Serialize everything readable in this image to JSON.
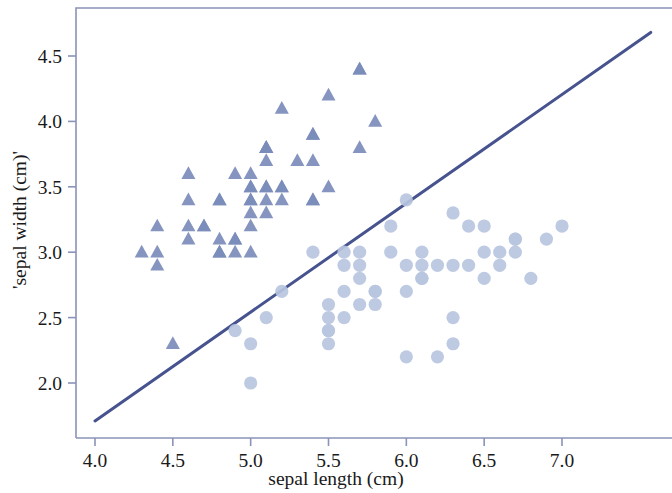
{
  "chart_data": {
    "type": "scatter",
    "title": "",
    "xlabel": "sepal length (cm)",
    "ylabel": "'sepal width (cm)'",
    "xlim": [
      3.75,
      7.65
    ],
    "ylim": [
      1.57,
      4.85
    ],
    "xticks": [
      4.0,
      4.5,
      5.0,
      5.5,
      6.0,
      6.5,
      7.0
    ],
    "xtick_labels": [
      "4.0",
      "4.5",
      "5.0",
      "5.5",
      "6.0",
      "6.5",
      "7.0"
    ],
    "yticks": [
      2.0,
      2.5,
      3.0,
      3.5,
      4.0,
      4.5
    ],
    "ytick_labels": [
      "2.0",
      "2.5",
      "3.0",
      "3.5",
      "4.0",
      "4.5"
    ],
    "grid": false,
    "legend": "none",
    "colors": {
      "triangle_marker": "#7b8cba",
      "circle_marker": "#b9c5e0",
      "fit_line": "#46538f",
      "frame": "#8a93b8",
      "text": "#1a1a1a",
      "background": "#ffffff"
    },
    "series": [
      {
        "name": "setosa",
        "marker": "triangle",
        "color": "#7b8cba",
        "points": [
          [
            4.3,
            3.0
          ],
          [
            4.4,
            3.2
          ],
          [
            4.4,
            3.0
          ],
          [
            4.4,
            2.9
          ],
          [
            4.5,
            2.3
          ],
          [
            4.6,
            3.6
          ],
          [
            4.6,
            3.4
          ],
          [
            4.6,
            3.2
          ],
          [
            4.6,
            3.1
          ],
          [
            4.7,
            3.2
          ],
          [
            4.7,
            3.2
          ],
          [
            4.8,
            3.4
          ],
          [
            4.8,
            3.4
          ],
          [
            4.8,
            3.1
          ],
          [
            4.8,
            3.0
          ],
          [
            4.8,
            3.0
          ],
          [
            4.9,
            3.6
          ],
          [
            4.9,
            3.1
          ],
          [
            4.9,
            3.1
          ],
          [
            4.9,
            3.0
          ],
          [
            5.0,
            3.6
          ],
          [
            5.0,
            3.5
          ],
          [
            5.0,
            3.4
          ],
          [
            5.0,
            3.4
          ],
          [
            5.0,
            3.3
          ],
          [
            5.0,
            3.2
          ],
          [
            5.0,
            3.0
          ],
          [
            5.0,
            3.5
          ],
          [
            5.1,
            3.8
          ],
          [
            5.1,
            3.8
          ],
          [
            5.1,
            3.7
          ],
          [
            5.1,
            3.5
          ],
          [
            5.1,
            3.5
          ],
          [
            5.1,
            3.4
          ],
          [
            5.1,
            3.3
          ],
          [
            5.1,
            3.8
          ],
          [
            5.2,
            4.1
          ],
          [
            5.2,
            3.5
          ],
          [
            5.2,
            3.4
          ],
          [
            5.2,
            3.5
          ],
          [
            5.3,
            3.7
          ],
          [
            5.4,
            3.9
          ],
          [
            5.4,
            3.9
          ],
          [
            5.4,
            3.7
          ],
          [
            5.4,
            3.4
          ],
          [
            5.4,
            3.4
          ],
          [
            5.5,
            4.2
          ],
          [
            5.5,
            3.5
          ],
          [
            5.7,
            4.4
          ],
          [
            5.7,
            4.4
          ],
          [
            5.7,
            3.8
          ],
          [
            5.8,
            4.0
          ]
        ]
      },
      {
        "name": "versicolor",
        "marker": "circle",
        "color": "#b9c5e0",
        "points": [
          [
            4.9,
            2.4
          ],
          [
            5.0,
            2.0
          ],
          [
            5.0,
            2.3
          ],
          [
            5.1,
            2.5
          ],
          [
            5.2,
            2.7
          ],
          [
            5.4,
            3.0
          ],
          [
            5.5,
            2.6
          ],
          [
            5.5,
            2.5
          ],
          [
            5.5,
            2.4
          ],
          [
            5.5,
            2.4
          ],
          [
            5.5,
            2.3
          ],
          [
            5.6,
            3.0
          ],
          [
            5.6,
            2.9
          ],
          [
            5.6,
            2.7
          ],
          [
            5.6,
            2.5
          ],
          [
            5.7,
            3.0
          ],
          [
            5.7,
            2.9
          ],
          [
            5.7,
            2.8
          ],
          [
            5.7,
            2.6
          ],
          [
            5.8,
            2.7
          ],
          [
            5.8,
            2.7
          ],
          [
            5.8,
            2.6
          ],
          [
            5.9,
            3.2
          ],
          [
            5.9,
            3.0
          ],
          [
            6.0,
            3.4
          ],
          [
            6.0,
            2.9
          ],
          [
            6.0,
            2.7
          ],
          [
            6.0,
            2.2
          ],
          [
            6.1,
            3.0
          ],
          [
            6.1,
            2.9
          ],
          [
            6.1,
            2.8
          ],
          [
            6.1,
            2.8
          ],
          [
            6.2,
            2.9
          ],
          [
            6.2,
            2.2
          ],
          [
            6.3,
            3.3
          ],
          [
            6.3,
            2.9
          ],
          [
            6.3,
            2.5
          ],
          [
            6.3,
            2.3
          ],
          [
            6.4,
            3.2
          ],
          [
            6.4,
            2.9
          ],
          [
            6.5,
            3.2
          ],
          [
            6.5,
            2.8
          ],
          [
            6.5,
            3.0
          ],
          [
            6.6,
            3.0
          ],
          [
            6.6,
            2.9
          ],
          [
            6.7,
            3.1
          ],
          [
            6.7,
            3.0
          ],
          [
            6.7,
            3.1
          ],
          [
            6.8,
            2.8
          ],
          [
            6.9,
            3.1
          ],
          [
            7.0,
            3.2
          ]
        ]
      }
    ],
    "fit_line": {
      "label": "regression line",
      "color": "#46538f",
      "x_start": 4.0,
      "y_start": 1.71,
      "x_end": 7.57,
      "y_end": 4.68
    }
  }
}
